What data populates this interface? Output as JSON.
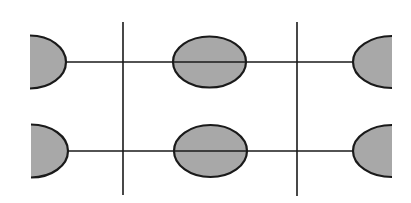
{
  "canvas": {
    "width": 411,
    "height": 203,
    "background": "#ffffff"
  },
  "colors": {
    "stroke": "#1a1a1a",
    "fill": "#a8a8a8"
  },
  "vertical_lines": [
    {
      "x": 123,
      "y1": 22,
      "y2": 195
    },
    {
      "x": 297,
      "y1": 22,
      "y2": 196
    }
  ],
  "horizontal_lines": [
    {
      "y": 62,
      "x1": 66,
      "x2": 353
    },
    {
      "y": 151,
      "x1": 68,
      "x2": 353
    }
  ],
  "full_ellipses": [
    {
      "cx": 209.5,
      "cy": 62,
      "rx": 36.5,
      "ry": 25.5
    },
    {
      "cx": 210.5,
      "cy": 151,
      "rx": 36.5,
      "ry": 26
    }
  ],
  "left_half_ellipses": [
    {
      "x_flat": 30,
      "cy": 62,
      "rx": 36,
      "ry": 26.5
    },
    {
      "x_flat": 31,
      "cy": 151,
      "rx": 37,
      "ry": 26.5
    }
  ],
  "right_half_ellipses": [
    {
      "x_flat": 392,
      "cy": 62,
      "rx": 39,
      "ry": 26
    },
    {
      "x_flat": 392,
      "cy": 151,
      "rx": 39,
      "ry": 26
    }
  ]
}
